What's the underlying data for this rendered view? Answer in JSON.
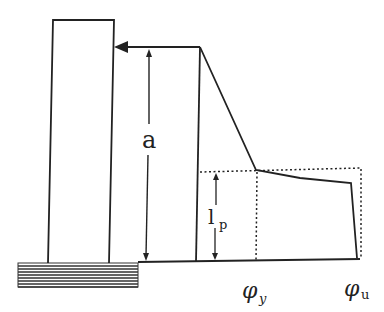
{
  "diagram": {
    "type": "plastic-hinge-curvature-diagram",
    "labels": {
      "shear_span": "a",
      "plastic_hinge_length_main": "l",
      "plastic_hinge_length_sub": "p",
      "yield_curvature_main": "φ",
      "yield_curvature_sub": "y",
      "ultimate_curvature_main": "φ",
      "ultimate_curvature_sub": "u"
    },
    "colors": {
      "line": "#222222",
      "hatch": "#333333",
      "background": "#ffffff"
    }
  }
}
